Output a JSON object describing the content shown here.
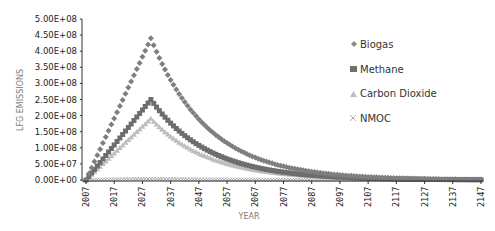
{
  "chart_data": {
    "type": "scatter",
    "title": "",
    "xlabel": "YEAR",
    "ylabel": "LFG EMISSIONS",
    "ylim": [
      0,
      500000000
    ],
    "xlim": [
      2007,
      2147
    ],
    "y_ticks": [
      "0.00E+00",
      "5.00E+07",
      "1.00E+08",
      "1.50E+08",
      "2.00E+08",
      "2.50E+08",
      "3.00E+08",
      "3.50E+08",
      "4.00E+08",
      "4.50E+08",
      "5.00E+08"
    ],
    "x_ticks": [
      "2007",
      "2017",
      "2027",
      "2037",
      "2047",
      "2057",
      "2067",
      "2077",
      "2087",
      "2097",
      "2107",
      "2117",
      "2127",
      "2137",
      "2147"
    ],
    "grid": false,
    "legend_position": "right",
    "series": [
      {
        "name": "Biogas",
        "marker": "diamond",
        "color": "#7f7f7f",
        "peak_year": 2030,
        "peak_value": 440000000,
        "sample_points": [
          [
            2007,
            0
          ],
          [
            2017,
            200000000
          ],
          [
            2027,
            380000000
          ],
          [
            2030,
            440000000
          ],
          [
            2037,
            310000000
          ],
          [
            2047,
            190000000
          ],
          [
            2057,
            115000000
          ],
          [
            2067,
            70000000
          ],
          [
            2077,
            42000000
          ],
          [
            2087,
            26000000
          ],
          [
            2097,
            16000000
          ],
          [
            2107,
            10000000
          ],
          [
            2117,
            6000000
          ],
          [
            2127,
            3600000
          ],
          [
            2137,
            2200000
          ],
          [
            2147,
            1300000
          ]
        ]
      },
      {
        "name": "Methane",
        "marker": "square",
        "color": "#6d6d6d",
        "peak_year": 2030,
        "peak_value": 250000000,
        "sample_points": [
          [
            2007,
            0
          ],
          [
            2017,
            113000000
          ],
          [
            2027,
            216000000
          ],
          [
            2030,
            250000000
          ],
          [
            2037,
            176000000
          ],
          [
            2047,
            108000000
          ],
          [
            2057,
            65000000
          ],
          [
            2067,
            40000000
          ],
          [
            2077,
            24000000
          ],
          [
            2087,
            15000000
          ],
          [
            2097,
            9000000
          ],
          [
            2107,
            5500000
          ],
          [
            2117,
            3400000
          ],
          [
            2127,
            2000000
          ],
          [
            2137,
            1250000
          ],
          [
            2147,
            750000
          ]
        ]
      },
      {
        "name": "Carbon Dioxide",
        "marker": "triangle",
        "color": "#bdbdbd",
        "peak_year": 2030,
        "peak_value": 190000000,
        "sample_points": [
          [
            2007,
            0
          ],
          [
            2017,
            87000000
          ],
          [
            2027,
            164000000
          ],
          [
            2030,
            190000000
          ],
          [
            2037,
            134000000
          ],
          [
            2047,
            82000000
          ],
          [
            2057,
            50000000
          ],
          [
            2067,
            30000000
          ],
          [
            2077,
            18000000
          ],
          [
            2087,
            11000000
          ],
          [
            2097,
            6800000
          ],
          [
            2107,
            4200000
          ],
          [
            2117,
            2600000
          ],
          [
            2127,
            1600000
          ],
          [
            2137,
            950000
          ],
          [
            2147,
            580000
          ]
        ]
      },
      {
        "name": "NMOC",
        "marker": "x",
        "color": "#999999",
        "peak_year": 2030,
        "peak_value": 3500000,
        "sample_points": [
          [
            2007,
            0
          ],
          [
            2017,
            1600000
          ],
          [
            2027,
            3000000
          ],
          [
            2030,
            3500000
          ],
          [
            2037,
            2500000
          ],
          [
            2047,
            1500000
          ],
          [
            2057,
            920000
          ],
          [
            2067,
            560000
          ],
          [
            2077,
            340000
          ],
          [
            2087,
            210000
          ],
          [
            2097,
            130000
          ],
          [
            2107,
            78000
          ],
          [
            2117,
            48000
          ],
          [
            2127,
            29000
          ],
          [
            2137,
            18000
          ],
          [
            2147,
            11000
          ]
        ]
      }
    ]
  },
  "legend": {
    "items": [
      {
        "label": "Biogas"
      },
      {
        "label": "Methane"
      },
      {
        "label": "Carbon Dioxide"
      },
      {
        "label": "NMOC"
      }
    ]
  }
}
